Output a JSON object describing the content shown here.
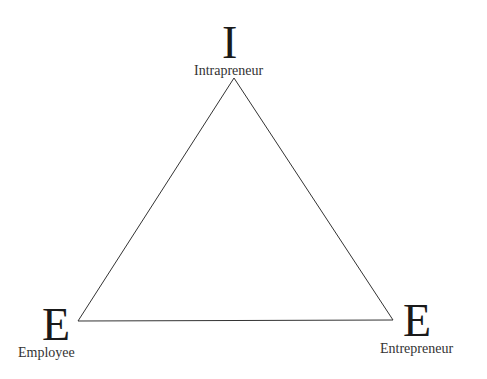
{
  "diagram": {
    "top": {
      "letter": "I",
      "label": "Intrapreneur"
    },
    "bottom_left": {
      "letter": "E",
      "label": "Employee"
    },
    "bottom_right": {
      "letter": "E",
      "label": "Entrepreneur"
    }
  }
}
